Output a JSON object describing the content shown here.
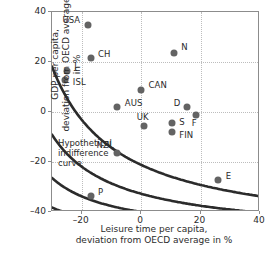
{
  "chart_data": {
    "type": "scatter",
    "title": "",
    "xlabel": "Leisure time per capita,\ndeviation from OECD average in %",
    "xlabel_line1": "Leisure time per capita,",
    "xlabel_line2": "deviation from OECD average in %",
    "ylabel_line1": "GDP per capita,",
    "ylabel_line2": "deviation from OECD average in %",
    "xlim": [
      -30,
      40
    ],
    "ylim": [
      -40,
      40
    ],
    "xticks": [
      -20,
      0,
      20,
      40
    ],
    "yticks": [
      40,
      20,
      0,
      -20,
      -40
    ],
    "xticklabels": [
      "–20",
      "0",
      "20",
      "40"
    ],
    "yticklabels": [
      "40",
      "20",
      "0",
      "–20",
      "–40"
    ],
    "grid": "dotted",
    "legend": "none",
    "marker_color": "#636363",
    "curve_color": "#2b2b2b",
    "frame_color": "#8c8c8c",
    "annotation": {
      "line1": "Hypothetical",
      "line2": "indifference",
      "line3": "curve"
    },
    "points": [
      {
        "label": "USA",
        "x": -18.0,
        "y": 35.0,
        "lx": -26.5,
        "ly": 36.5
      },
      {
        "label": "CH",
        "x": -17.0,
        "y": 21.5,
        "lx": -14.5,
        "ly": 23.0
      },
      {
        "label": "J",
        "x": -25.0,
        "y": 16.5,
        "lx": -22.5,
        "ly": 18.0
      },
      {
        "label": "ISL",
        "x": -25.5,
        "y": 13.0,
        "lx": -23.0,
        "ly": 11.8
      },
      {
        "label": "N",
        "x": 11.0,
        "y": 23.5,
        "lx": 13.5,
        "ly": 25.5
      },
      {
        "label": "CAN",
        "x": 0.0,
        "y": 9.0,
        "lx": 2.5,
        "ly": 10.5
      },
      {
        "label": "AUS",
        "x": -8.0,
        "y": 2.0,
        "lx": -5.5,
        "ly": 3.3
      },
      {
        "label": "D",
        "x": 15.5,
        "y": 2.0,
        "lx": 11.0,
        "ly": 3.3
      },
      {
        "label": "F",
        "x": 18.5,
        "y": -1.0,
        "lx": 17.0,
        "ly": -4.6
      },
      {
        "label": "UK",
        "x": 1.0,
        "y": -5.5,
        "lx": -1.5,
        "ly": -2.3
      },
      {
        "label": "S",
        "x": 10.5,
        "y": -4.5,
        "lx": 12.8,
        "ly": -4.3
      },
      {
        "label": "FIN",
        "x": 10.5,
        "y": -8.0,
        "lx": 12.8,
        "ly": -9.6
      },
      {
        "label": "NZL",
        "x": -8.0,
        "y": -16.5,
        "lx": -15.0,
        "ly": -13.5
      },
      {
        "label": "E",
        "x": 26.0,
        "y": -27.0,
        "lx": 28.5,
        "ly": -26.0
      },
      {
        "label": "P",
        "x": -17.0,
        "y": -33.5,
        "lx": -14.5,
        "ly": -32.5
      }
    ],
    "curves": [
      {
        "name": "indifference-curve-1",
        "k": 260,
        "shift_x": 52,
        "shift_y": 50
      },
      {
        "name": "indifference-curve-2",
        "k": 520,
        "shift_x": 52,
        "shift_y": 50
      },
      {
        "name": "indifference-curve-3",
        "k": 900,
        "shift_x": 52,
        "shift_y": 50
      },
      {
        "name": "indifference-curve-4",
        "k": 1500,
        "shift_x": 52,
        "shift_y": 50
      }
    ]
  }
}
